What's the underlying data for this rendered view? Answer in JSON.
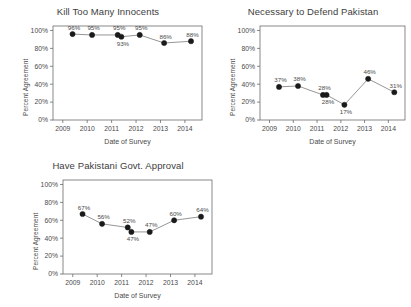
{
  "figure": {
    "background": "#ffffff",
    "line_color": "#8a8a8a",
    "marker_color": "#1a1a1a",
    "axis_color": "#6b6b6b",
    "text_color": "#4a4a4a"
  },
  "chart_data": [
    {
      "type": "line",
      "title": "Kill Too Many Innocents",
      "xlabel": "Date of Survey",
      "ylabel": "Percent Agreement",
      "xlim": [
        2008.6,
        2014.7
      ],
      "ylim": [
        0,
        105
      ],
      "grid": false,
      "legend": "none",
      "xticks": [
        "2009",
        "2010",
        "2011",
        "2012",
        "2013",
        "2014"
      ],
      "xtick_values": [
        2009,
        2010,
        2011,
        2012,
        2013,
        2014
      ],
      "yticks": [
        "0%",
        "20%",
        "40%",
        "60%",
        "80%",
        "100%"
      ],
      "ytick_values": [
        0,
        20,
        40,
        60,
        80,
        100
      ],
      "x": [
        2009.4,
        2010.2,
        2011.25,
        2011.4,
        2012.15,
        2013.15,
        2014.25
      ],
      "values": [
        96,
        95,
        95,
        93,
        95,
        86,
        88
      ],
      "labels": [
        "96%",
        "95%",
        "95%",
        "93%",
        "95%",
        "86%",
        "88%"
      ],
      "label_positions": [
        "above",
        "above",
        "above",
        "below",
        "above",
        "above",
        "above"
      ]
    },
    {
      "type": "line",
      "title": "Necessary to Defend Pakistan",
      "xlabel": "Date of Survey",
      "ylabel": "Percent Agreement",
      "xlim": [
        2008.6,
        2014.7
      ],
      "ylim": [
        0,
        105
      ],
      "grid": false,
      "legend": "none",
      "xticks": [
        "2009",
        "2010",
        "2011",
        "2012",
        "2013",
        "2014"
      ],
      "xtick_values": [
        2009,
        2010,
        2011,
        2012,
        2013,
        2014
      ],
      "yticks": [
        "0%",
        "20%",
        "40%",
        "60%",
        "80%",
        "100%"
      ],
      "ytick_values": [
        0,
        20,
        40,
        60,
        80,
        100
      ],
      "x": [
        2009.4,
        2010.2,
        2011.25,
        2011.4,
        2012.15,
        2013.15,
        2014.25
      ],
      "values": [
        37,
        38,
        28,
        28,
        17,
        46,
        31
      ],
      "labels": [
        "37%",
        "38%",
        "28%",
        "28%",
        "17%",
        "46%",
        "31%"
      ],
      "label_positions": [
        "above",
        "above",
        "above",
        "below",
        "below",
        "above",
        "above"
      ]
    },
    {
      "type": "line",
      "title": "Have Pakistani Govt. Approval",
      "xlabel": "Date of Survey",
      "ylabel": "Percent Agreement",
      "xlim": [
        2008.6,
        2014.7
      ],
      "ylim": [
        0,
        105
      ],
      "grid": false,
      "legend": "none",
      "xticks": [
        "2009",
        "2010",
        "2011",
        "2012",
        "2013",
        "2014"
      ],
      "xtick_values": [
        2009,
        2010,
        2011,
        2012,
        2013,
        2014
      ],
      "yticks": [
        "0%",
        "20%",
        "40%",
        "60%",
        "80%",
        "100%"
      ],
      "ytick_values": [
        0,
        20,
        40,
        60,
        80,
        100
      ],
      "x": [
        2009.4,
        2010.2,
        2011.25,
        2011.4,
        2012.15,
        2013.15,
        2014.25
      ],
      "values": [
        67,
        56,
        52,
        47,
        47,
        60,
        64
      ],
      "labels": [
        "67%",
        "56%",
        "52%",
        "47%",
        "47%",
        "60%",
        "64%"
      ],
      "label_positions": [
        "above",
        "above",
        "above",
        "below",
        "above",
        "above",
        "above"
      ]
    }
  ]
}
